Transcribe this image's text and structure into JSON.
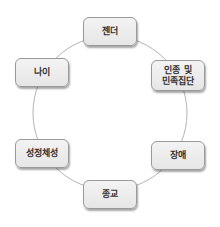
{
  "diagram": {
    "type": "cycle",
    "colors": {
      "ring": "#b4b4b4",
      "node_fill": "#eeeeee",
      "node_border": "#9a9a9a",
      "text": "#333333"
    },
    "nodes": [
      {
        "id": "gender",
        "label": "젠더"
      },
      {
        "id": "race-ethnicity",
        "label": "인종 및\n민족집단"
      },
      {
        "id": "disability",
        "label": "장애"
      },
      {
        "id": "religion",
        "label": "종교"
      },
      {
        "id": "sexual-identity",
        "label": "성정체성"
      },
      {
        "id": "age",
        "label": "나이"
      }
    ]
  }
}
